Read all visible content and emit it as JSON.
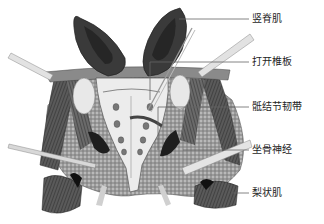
{
  "figure": {
    "labels": [
      {
        "id": "erector-spinae",
        "text": "竖脊肌",
        "line_y": 19
      },
      {
        "id": "open-lamina",
        "text": "打开椎板",
        "line_y": 62
      },
      {
        "id": "sacrotuberous-ligament",
        "text": "骶结节韧带",
        "line_y": 107
      },
      {
        "id": "sciatic-nerve",
        "text": "坐骨神经",
        "line_y": 150
      },
      {
        "id": "piriformis",
        "text": "梨状肌",
        "line_y": 193
      }
    ]
  }
}
